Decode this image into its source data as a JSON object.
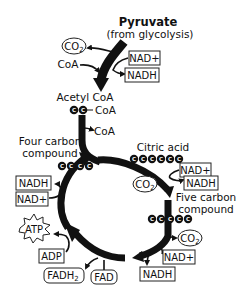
{
  "diagram": {
    "type": "krebs-cycle",
    "colors": {
      "ink": "#111111",
      "background": "#ffffff"
    },
    "start": {
      "title": "Pyruvate",
      "subtitle": "(from glycolysis)"
    },
    "pyruvate_step": {
      "outputs": {
        "co2": "CO2",
        "nad_plus": "NAD+",
        "nadh": "NADH"
      },
      "input_coa": "CoA",
      "product": "Acetyl CoA",
      "acetyl_coa_carbons": 2,
      "acetyl_coa_tag": "CoA"
    },
    "cycle": {
      "coa_released": "CoA",
      "citric_acid": {
        "label": "Citric acid",
        "carbons": 6
      },
      "five_carbon": {
        "label_line1": "Five carbon",
        "label_line2": "compound",
        "carbons": 5
      },
      "four_carbon": {
        "label_line1": "Four carbon",
        "label_line2": "compound",
        "carbons": 4
      },
      "step_citric_to_five": {
        "nad_plus": "NAD+",
        "nadh": "NADH",
        "co2": "CO2"
      },
      "step_five_to_four": {
        "co2": "CO2",
        "nad_plus": "NAD+",
        "nadh": "NADH"
      },
      "step_fad": {
        "fad": "FAD",
        "fadh2": "FADH2"
      },
      "step_atp": {
        "adp": "ADP",
        "atp": "ATP"
      },
      "step_four_regen": {
        "nad_plus": "NAD+",
        "nadh": "NADH"
      }
    },
    "carbon_glyph": "C"
  }
}
